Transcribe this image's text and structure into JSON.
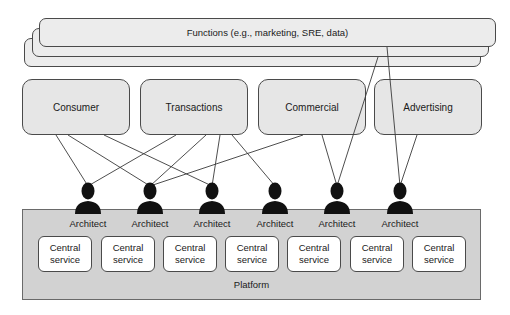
{
  "functions": {
    "label": "Functions (e.g., marketing, SRE, data)",
    "stack_count": 3
  },
  "domains": [
    {
      "label": "Consumer"
    },
    {
      "label": "Transactions"
    },
    {
      "label": "Commercial"
    },
    {
      "label": "Advertising"
    }
  ],
  "architects": [
    {
      "label": "Architect"
    },
    {
      "label": "Architect"
    },
    {
      "label": "Architect"
    },
    {
      "label": "Architect"
    },
    {
      "label": "Architect"
    },
    {
      "label": "Architect"
    }
  ],
  "services": [
    {
      "line1": "Central",
      "line2": "service"
    },
    {
      "line1": "Central",
      "line2": "service"
    },
    {
      "line1": "Central",
      "line2": "service"
    },
    {
      "line1": "Central",
      "line2": "service"
    },
    {
      "line1": "Central",
      "line2": "service"
    },
    {
      "line1": "Central",
      "line2": "service"
    },
    {
      "line1": "Central",
      "line2": "service"
    }
  ],
  "platform": {
    "label": "Platform"
  },
  "connections": [
    {
      "from": "Consumer",
      "to_architect": 1
    },
    {
      "from": "Consumer",
      "to_architect": 2
    },
    {
      "from": "Consumer",
      "to_architect": 3
    },
    {
      "from": "Transactions",
      "to_architect": 1
    },
    {
      "from": "Transactions",
      "to_architect": 2
    },
    {
      "from": "Transactions",
      "to_architect": 3
    },
    {
      "from": "Transactions",
      "to_architect": 4
    },
    {
      "from": "Commercial",
      "to_architect": 2
    },
    {
      "from": "Commercial",
      "to_architect": 5
    },
    {
      "from": "Functions",
      "to_architect": 5
    },
    {
      "from": "Functions",
      "to_architect": 6
    },
    {
      "from": "Advertising",
      "to_architect": 6
    }
  ]
}
